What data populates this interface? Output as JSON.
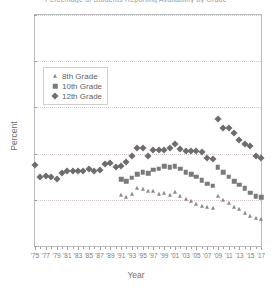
{
  "chart_data": {
    "type": "scatter",
    "title": "Percentage of Students Reporting Availability by Grade",
    "xlabel": "Year",
    "ylabel": "Percent",
    "xlim": [
      1975,
      2017
    ],
    "ylim": [
      0,
      100
    ],
    "yticks": [
      0,
      20,
      40,
      60,
      80,
      100
    ],
    "xticks": [
      1975,
      1977,
      1979,
      1981,
      1983,
      1985,
      1987,
      1989,
      1991,
      1993,
      1995,
      1997,
      1999,
      2001,
      2003,
      2005,
      2007,
      2009,
      2011,
      2013,
      2015,
      2017
    ],
    "xtick_labels": [
      "'75",
      "'77",
      "'79",
      "'81",
      "'83",
      "'85",
      "'87",
      "'89",
      "'91",
      "'93",
      "'95",
      "'97",
      "'99",
      "'01",
      "'03",
      "'05",
      "'07",
      "'09",
      "'11",
      "'13",
      "'15",
      "'17"
    ],
    "grid": "horizontal-dotted",
    "legend_position": "upper-left-inside",
    "marker_color": "#6d6d6d",
    "series": [
      {
        "name": "8th Grade",
        "marker": "triangle",
        "color": "#8a8a8a",
        "points": [
          {
            "x": 1991,
            "y": 22.0
          },
          {
            "x": 1992,
            "y": 21.4
          },
          {
            "x": 1993,
            "y": 22.5
          },
          {
            "x": 1994,
            "y": 25.0
          },
          {
            "x": 1995,
            "y": 24.5
          },
          {
            "x": 1996,
            "y": 24.0
          },
          {
            "x": 1997,
            "y": 23.8
          },
          {
            "x": 1998,
            "y": 22.5
          },
          {
            "x": 1999,
            "y": 23.0
          },
          {
            "x": 2000,
            "y": 22.0
          },
          {
            "x": 2001,
            "y": 23.5
          },
          {
            "x": 2002,
            "y": 21.5
          },
          {
            "x": 2003,
            "y": 20.5
          },
          {
            "x": 2004,
            "y": 19.5
          },
          {
            "x": 2005,
            "y": 18.0
          },
          {
            "x": 2006,
            "y": 17.5
          },
          {
            "x": 2007,
            "y": 17.0
          },
          {
            "x": 2008,
            "y": 16.5
          },
          {
            "x": 2009,
            "y": 21.5
          },
          {
            "x": 2010,
            "y": 20.0
          },
          {
            "x": 2011,
            "y": 18.5
          },
          {
            "x": 2012,
            "y": 17.0
          },
          {
            "x": 2013,
            "y": 16.0
          },
          {
            "x": 2014,
            "y": 14.5
          },
          {
            "x": 2015,
            "y": 13.0
          },
          {
            "x": 2016,
            "y": 12.0
          },
          {
            "x": 2017,
            "y": 11.5
          }
        ]
      },
      {
        "name": "10th Grade",
        "marker": "square",
        "color": "#7a7a7a",
        "points": [
          {
            "x": 1991,
            "y": 29.0
          },
          {
            "x": 1992,
            "y": 28.0
          },
          {
            "x": 1993,
            "y": 29.5
          },
          {
            "x": 1994,
            "y": 31.0
          },
          {
            "x": 1995,
            "y": 32.0
          },
          {
            "x": 1996,
            "y": 31.5
          },
          {
            "x": 1997,
            "y": 33.0
          },
          {
            "x": 1998,
            "y": 33.5
          },
          {
            "x": 1999,
            "y": 34.5
          },
          {
            "x": 2000,
            "y": 34.0
          },
          {
            "x": 2001,
            "y": 34.5
          },
          {
            "x": 2002,
            "y": 33.5
          },
          {
            "x": 2003,
            "y": 32.0
          },
          {
            "x": 2004,
            "y": 31.0
          },
          {
            "x": 2005,
            "y": 30.0
          },
          {
            "x": 2006,
            "y": 28.5
          },
          {
            "x": 2007,
            "y": 27.0
          },
          {
            "x": 2008,
            "y": 26.0
          },
          {
            "x": 2009,
            "y": 34.0
          },
          {
            "x": 2010,
            "y": 32.0
          },
          {
            "x": 2011,
            "y": 30.0
          },
          {
            "x": 2012,
            "y": 28.0
          },
          {
            "x": 2013,
            "y": 26.5
          },
          {
            "x": 2014,
            "y": 25.0
          },
          {
            "x": 2015,
            "y": 23.0
          },
          {
            "x": 2016,
            "y": 21.5
          },
          {
            "x": 2017,
            "y": 21.0
          }
        ]
      },
      {
        "name": "12th Grade",
        "marker": "diamond",
        "color": "#6d6d6d",
        "points": [
          {
            "x": 1975,
            "y": 35.0
          },
          {
            "x": 1976,
            "y": 30.0
          },
          {
            "x": 1977,
            "y": 30.5
          },
          {
            "x": 1978,
            "y": 30.0
          },
          {
            "x": 1979,
            "y": 29.0
          },
          {
            "x": 1980,
            "y": 31.5
          },
          {
            "x": 1981,
            "y": 32.5
          },
          {
            "x": 1982,
            "y": 32.5
          },
          {
            "x": 1983,
            "y": 32.5
          },
          {
            "x": 1984,
            "y": 32.5
          },
          {
            "x": 1985,
            "y": 33.5
          },
          {
            "x": 1986,
            "y": 32.5
          },
          {
            "x": 1987,
            "y": 33.0
          },
          {
            "x": 1988,
            "y": 35.5
          },
          {
            "x": 1989,
            "y": 36.0
          },
          {
            "x": 1990,
            "y": 34.0
          },
          {
            "x": 1991,
            "y": 34.5
          },
          {
            "x": 1992,
            "y": 36.5
          },
          {
            "x": 1993,
            "y": 39.0
          },
          {
            "x": 1994,
            "y": 42.5
          },
          {
            "x": 1995,
            "y": 42.5
          },
          {
            "x": 1996,
            "y": 39.0
          },
          {
            "x": 1997,
            "y": 41.5
          },
          {
            "x": 1998,
            "y": 41.5
          },
          {
            "x": 1999,
            "y": 41.5
          },
          {
            "x": 2000,
            "y": 42.5
          },
          {
            "x": 2001,
            "y": 44.0
          },
          {
            "x": 2002,
            "y": 42.0
          },
          {
            "x": 2003,
            "y": 41.0
          },
          {
            "x": 2004,
            "y": 41.0
          },
          {
            "x": 2005,
            "y": 41.0
          },
          {
            "x": 2006,
            "y": 40.5
          },
          {
            "x": 2007,
            "y": 38.0
          },
          {
            "x": 2008,
            "y": 37.5
          },
          {
            "x": 2009,
            "y": 55.0
          },
          {
            "x": 2010,
            "y": 51.0
          },
          {
            "x": 2011,
            "y": 51.0
          },
          {
            "x": 2012,
            "y": 49.0
          },
          {
            "x": 2013,
            "y": 46.0
          },
          {
            "x": 2014,
            "y": 44.0
          },
          {
            "x": 2015,
            "y": 43.5
          },
          {
            "x": 2016,
            "y": 39.0
          },
          {
            "x": 2017,
            "y": 38.0
          }
        ]
      }
    ]
  },
  "legend": {
    "items": [
      {
        "label": "8th Grade",
        "marker": "triangle"
      },
      {
        "label": "10th Grade",
        "marker": "square"
      },
      {
        "label": "12th Grade",
        "marker": "diamond"
      }
    ]
  }
}
